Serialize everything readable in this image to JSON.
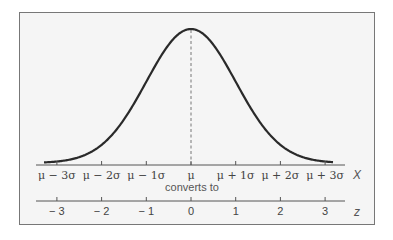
{
  "chart_data": {
    "type": "line",
    "title": "",
    "x_axis": {
      "name": "X",
      "ticks": [
        "μ − 3σ",
        "μ − 2σ",
        "μ − 1σ",
        "μ",
        "μ + 1σ",
        "μ + 2σ",
        "μ + 3σ"
      ]
    },
    "conversion_label": "converts to",
    "z_axis": {
      "name": "z",
      "ticks": [
        "− 3",
        "− 2",
        "− 1",
        "0",
        "1",
        "2",
        "3"
      ]
    },
    "mean_line": "dashed vertical line at μ",
    "z_values": [
      -3,
      -2,
      -1,
      0,
      1,
      2,
      3
    ]
  },
  "colors": {
    "curve": "#2a2a2a",
    "axis": "#555555",
    "background": "#f5f5f5",
    "frame": "#777777"
  }
}
